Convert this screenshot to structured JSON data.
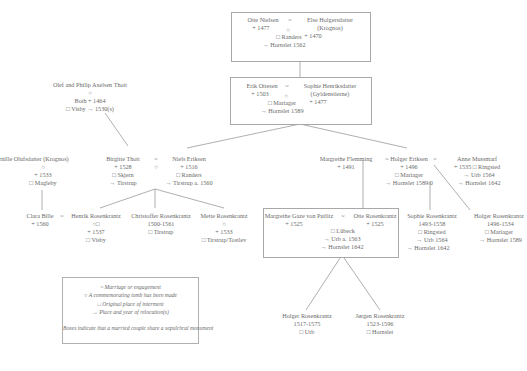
{
  "persons": {
    "otte_nielsen": {
      "name": "Otte Nielsen",
      "death": "+ 1477"
    },
    "else_holgersdatter": {
      "name": "Else Holgersdatter",
      "house": "(Krognos)",
      "death": "+ 1470"
    },
    "couple1": {
      "tilde": "~",
      "circle": "○",
      "burial": "□ Randers",
      "relocation": "→ Hornslet 1562"
    },
    "erik_ottesen": {
      "name": "Erik Ottesen",
      "death": "+ 1503"
    },
    "sophie_henriksdatter": {
      "name": "Sophie Henriksdatter",
      "house": "(Gyldenstierne)",
      "death": "+ 1477"
    },
    "couple2": {
      "tilde": "~",
      "circle": "○",
      "burial": "□ Mariager",
      "relocation": "→ Hornslet 1589"
    },
    "olef_philip": {
      "name": "Olef and Philip Axelsen Thott",
      "circle": "○",
      "info": "Both + 1464",
      "burial": "□ Visby → 1530(s)"
    },
    "pernille": {
      "name": "Pernille Olufsdatter (Krognos)",
      "circle": "○",
      "death": "+ 1533",
      "burial": "□ Magleby"
    },
    "birgitte_thott": {
      "name": "Birgitte Thott",
      "death": "+ 1528",
      "burial": "□ Skjern",
      "relocation": "→ Tirstrup"
    },
    "couple3": {
      "tilde": "~",
      "circle": "○"
    },
    "niels_eriksen": {
      "name": "Niels Eriksen",
      "death": "+ 1516",
      "burial": "□ Randers",
      "relocation": "→ Tirstrup a. 1560"
    },
    "margrethe_flemming": {
      "name": "Margrethe Flemming",
      "death": "+ 1491"
    },
    "couple4": {
      "tilde": "~"
    },
    "holger_eriksen": {
      "name": "Holger Eriksen",
      "death": "+ 1496",
      "burial": "□ Mariager",
      "relocation": "→ Hornslet 1589/0"
    },
    "couple5": {
      "tilde": "~"
    },
    "anne_mussmarf": {
      "name": "Anne Mussmarf",
      "death_burial": "+ 1535 □ Ringsted",
      "relocation1": "→ Urb 1564",
      "relocation2": "→ Hornslet 1642"
    },
    "clara_bille": {
      "name": "Clara Bille",
      "death": "+ 1560"
    },
    "couple6": {
      "tilde": "~"
    },
    "henrik_rosenkrantz": {
      "name": "Henrik Rosenkrantz",
      "symbols": "○□",
      "death": "+ 1537",
      "burial": "□ Visby"
    },
    "christoffer_rosenkrantz": {
      "name": "Christoffer Rosenkrantz",
      "dates": "1500-1561",
      "burial": "□ Tirstrup"
    },
    "mette_rosenkrantz": {
      "name": "Mette Rosenkrantz",
      "circle": "○",
      "death": "+ 1533",
      "burial": "□ Tirstrup/Tostlev"
    },
    "margrethe_gaze": {
      "name": "Margrethe Gaze von Putlitz",
      "death": "+ 1525"
    },
    "otte_rosenkrantz": {
      "name": "Otte Rosenkrantz",
      "death": "+ 1525"
    },
    "couple7": {
      "tilde": "~",
      "burial": "□ Lübeck",
      "relocation1": "→ Urb a. 1563",
      "relocation2": "→ Hornslet 1642"
    },
    "sophie_rosenkrantz": {
      "name": "Sophie Rosenkrantz",
      "dates": "1493-1558",
      "burial": "□ Ringsted",
      "relocation1": "→ Urb 1564",
      "relocation2": "→ Hornslet 1642"
    },
    "holger_rosenkrantz_1": {
      "name": "Holger Rosenkrantz",
      "dates": "1496-1534",
      "burial": "□ Mariager",
      "relocation": "→ Hornslet 1589"
    },
    "holger_rosenkrantz_2": {
      "name": "Holger Rosenkrantz",
      "dates": "1517-1575",
      "burial": "□ Urb"
    },
    "jorgen_rosenkrantz": {
      "name": "Jørgen Rosenkrantz",
      "dates": "1523-1596",
      "burial": "□ Hornslet"
    }
  },
  "legend": {
    "items": [
      "~ Marriage or engagement",
      "○ A commemorating tomb has been made",
      "□ Original place of interment",
      "→ Place and year of relocation(s)"
    ],
    "note": "Boxes indicate that a married couple share a sepulchral monument"
  }
}
